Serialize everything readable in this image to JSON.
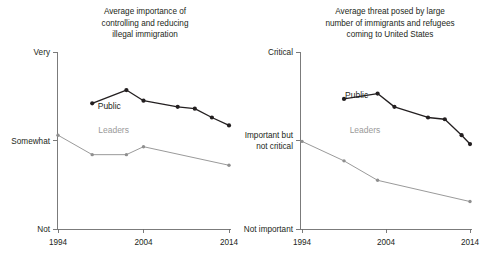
{
  "figure": {
    "background_color": "#ffffff",
    "public_color": "#231f20",
    "leaders_color": "#9a9a9a",
    "axis_color": "#6d6d6d"
  },
  "chart_data": [
    {
      "id": "left",
      "type": "line",
      "title": "Average importance of controlling and reducing illegal immigration",
      "title_lines": [
        "Average importance of",
        "controlling and reducing",
        "illegal immigration"
      ],
      "xlabel": "",
      "ylabel": "",
      "grid": false,
      "legend_position": "inline",
      "xlim": [
        1994,
        2014
      ],
      "xticks": [
        1994,
        2004,
        2014
      ],
      "xtick_labels": [
        "1994",
        "2004",
        "2014"
      ],
      "ylim": [
        0,
        2
      ],
      "yticks": [
        0,
        1,
        2
      ],
      "ytick_labels": [
        "Not",
        "Somewhat",
        "Very"
      ],
      "ytick_label_lines": [
        [
          "Not"
        ],
        [
          "Somewhat"
        ],
        [
          "Very"
        ]
      ],
      "series": [
        {
          "name": "Public",
          "color": "#231f20",
          "label": "Public",
          "label_x": 2000.0,
          "label_y": 1.36,
          "x": [
            1998,
            2002,
            2004,
            2008,
            2010,
            2012,
            2014
          ],
          "y": [
            1.42,
            1.57,
            1.45,
            1.38,
            1.36,
            1.26,
            1.17
          ]
        },
        {
          "name": "Leaders",
          "color": "#9a9a9a",
          "label": "Leaders",
          "label_x": 2000.5,
          "label_y": 1.08,
          "x": [
            1994,
            1998,
            2002,
            2004,
            2014
          ],
          "y": [
            1.06,
            0.84,
            0.84,
            0.93,
            0.72
          ]
        }
      ]
    },
    {
      "id": "right",
      "type": "line",
      "title": "Average threat posed by large number of immigrants and refugees coming to United States",
      "title_lines": [
        "Average threat posed by large",
        "number of immigrants and refugees",
        "coming to United States"
      ],
      "xlabel": "",
      "ylabel": "",
      "grid": false,
      "legend_position": "inline",
      "xlim": [
        1994,
        2014
      ],
      "xticks": [
        1994,
        2004,
        2014
      ],
      "xtick_labels": [
        "1994",
        "2004",
        "2014"
      ],
      "ylim": [
        0,
        2
      ],
      "yticks": [
        0,
        1,
        2
      ],
      "ytick_labels": [
        "Not important",
        "Important but not critical",
        "Critical"
      ],
      "ytick_label_lines": [
        [
          "Not important"
        ],
        [
          "Important but",
          "not critical"
        ],
        [
          "Critical"
        ]
      ],
      "series": [
        {
          "name": "Public",
          "color": "#231f20",
          "label": "Public",
          "label_x": 2000.5,
          "label_y": 1.48,
          "x": [
            1999,
            2003,
            2005,
            2009,
            2011,
            2013,
            2014
          ],
          "y": [
            1.47,
            1.53,
            1.38,
            1.26,
            1.24,
            1.06,
            0.96
          ]
        },
        {
          "name": "Leaders",
          "color": "#9a9a9a",
          "label": "Leaders",
          "label_x": 2001.5,
          "label_y": 1.08,
          "x": [
            1994,
            1999,
            2003,
            2014
          ],
          "y": [
            0.99,
            0.77,
            0.55,
            0.31
          ]
        }
      ]
    }
  ]
}
